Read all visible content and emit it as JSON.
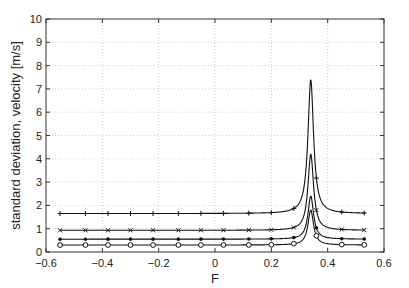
{
  "chart_data": {
    "type": "line",
    "title": "",
    "xlabel": "F",
    "ylabel": "standard deviation, velocity [m/s]",
    "xlim": [
      -0.6,
      0.6
    ],
    "ylim": [
      0,
      10
    ],
    "xticks": [
      -0.6,
      -0.4,
      -0.2,
      0,
      0.2,
      0.4,
      0.6
    ],
    "xtick_labels": [
      "-0.6",
      "-0.4",
      "-0.2",
      "0",
      "0.2",
      "0.4",
      "0.6"
    ],
    "yticks": [
      0,
      1,
      2,
      3,
      4,
      5,
      6,
      7,
      8,
      9,
      10
    ],
    "ytick_labels": [
      "0",
      "1",
      "2",
      "3",
      "4",
      "5",
      "6",
      "7",
      "8",
      "9",
      "10"
    ],
    "grid": true,
    "legend": null,
    "peak_x": 0.34,
    "marker_x": [
      -0.55,
      -0.46,
      -0.38,
      -0.3,
      -0.22,
      -0.13,
      -0.05,
      0.03,
      0.12,
      0.2,
      0.28,
      0.36,
      0.45,
      0.53
    ],
    "series": [
      {
        "name": "series-plus",
        "marker": "+",
        "baseline": 1.65,
        "peak": 7.4
      },
      {
        "name": "series-x",
        "marker": "x",
        "baseline": 0.93,
        "peak": 4.2
      },
      {
        "name": "series-dot",
        "marker": "*",
        "baseline": 0.55,
        "peak": 2.4
      },
      {
        "name": "series-circle",
        "marker": "o",
        "baseline": 0.3,
        "peak": 1.8
      }
    ],
    "colors": {
      "line": "#111111",
      "grid": "#bbbbbb",
      "axis": "#333333"
    }
  }
}
